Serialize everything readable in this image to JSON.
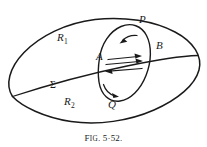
{
  "figure": {
    "caption_prefix": "F",
    "caption_smallcaps": "IG",
    "caption_number": ". 5·52.",
    "caption_full": "Fig. 5·52.",
    "ink_color": "#1a1a1a",
    "background_color": "#ffffff"
  },
  "labels": {
    "region_upper": {
      "symbol": "R",
      "subscript": "1",
      "x": 60,
      "y": 38
    },
    "region_lower": {
      "symbol": "R",
      "subscript": "2",
      "x": 67,
      "y": 102
    },
    "surface": {
      "symbol": "Σ",
      "x": 53,
      "y": 87
    },
    "point_a": {
      "symbol": "A",
      "x": 99,
      "y": 57
    },
    "point_b": {
      "symbol": "B",
      "x": 158,
      "y": 46
    },
    "point_p": {
      "symbol": "P",
      "x": 141,
      "y": 20
    },
    "point_q": {
      "symbol": "Q",
      "x": 110,
      "y": 104
    }
  },
  "geometry": {
    "outer_ellipse": {
      "description": "large tilted ellipse boundary",
      "cx": 103,
      "cy": 69,
      "rx": 95,
      "ry": 47,
      "rotation_deg": -16
    },
    "inner_ellipse": {
      "description": "small tilted ellipse crossing at A and B",
      "cx": 124,
      "cy": 63,
      "rx": 24,
      "ry": 39,
      "rotation_deg": 28
    },
    "sigma_line": {
      "description": "curve sigma dividing R1 and R2",
      "start_x": 13,
      "start_y": 97,
      "end_x": 198,
      "end_y": 56
    }
  },
  "arrows": {
    "between_a_and_b": [
      {
        "name": "upper-right-arrow",
        "direction": "right",
        "x1": 108,
        "y1": 59,
        "x2": 140,
        "y2": 56
      },
      {
        "name": "middle-right-arrow",
        "direction": "right",
        "x1": 106,
        "y1": 64,
        "x2": 142,
        "y2": 61
      },
      {
        "name": "lower-left-arrow",
        "direction": "left",
        "x1": 141,
        "y1": 69,
        "x2": 105,
        "y2": 71
      }
    ],
    "on_inner_ellipse": [
      {
        "name": "top-arc-arrow",
        "direction": "left",
        "position": "near P"
      },
      {
        "name": "bottom-arc-arrow",
        "direction": "right",
        "position": "near Q"
      }
    ]
  }
}
